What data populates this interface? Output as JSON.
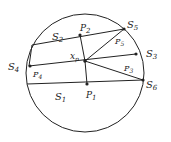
{
  "diagram": {
    "stroke_color": "#222222",
    "circle": {
      "cx": 85,
      "cy": 73,
      "r": 59
    },
    "center_point": {
      "label": "x",
      "sub": "p",
      "x": 85,
      "y": 61
    },
    "labels": {
      "S1": {
        "main": "S",
        "sub": "1"
      },
      "S2": {
        "main": "S",
        "sub": "2"
      },
      "S3": {
        "main": "S",
        "sub": "3"
      },
      "S4": {
        "main": "S",
        "sub": "4"
      },
      "S5": {
        "main": "S",
        "sub": "5"
      },
      "S6": {
        "main": "S",
        "sub": "6"
      },
      "P1": {
        "main": "P",
        "sub": "1"
      },
      "P2": {
        "main": "P",
        "sub": "2"
      },
      "P3": {
        "main": "P",
        "sub": "3"
      },
      "P4": {
        "main": "P",
        "sub": "4"
      },
      "P5": {
        "main": "P",
        "sub": "5"
      }
    }
  }
}
